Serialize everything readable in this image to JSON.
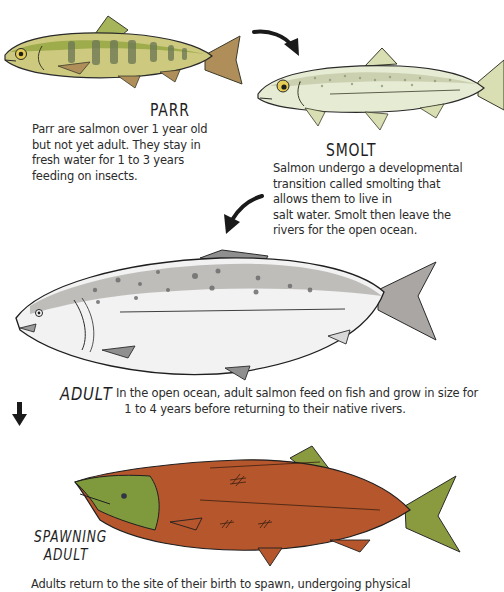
{
  "diagram": {
    "type": "life-cycle",
    "subject": "Salmon",
    "stages": [
      {
        "name": "PARR",
        "description_lines": [
          "Parr are salmon over 1 year old",
          "but not yet adult. They stay in",
          "fresh water for 1 to 3 years",
          "feeding on insects."
        ],
        "colors": {
          "body": "#c9c77a",
          "back": "#8ea23a",
          "bars": "#6f7a55",
          "fins": "#b08e5a"
        }
      },
      {
        "name": "SMOLT",
        "description_lines": [
          "Salmon undergo a developmental",
          "transition called smolting that",
          "allows them to live in",
          "salt water. Smolt then leave the",
          "rivers for the open ocean."
        ],
        "colors": {
          "body": "#e6ecd3",
          "back": "#c4c9a8",
          "fins": "#d9dfb2"
        }
      },
      {
        "name": "ADULT",
        "description_lines": [
          "In the open ocean, adult salmon feed on fish and grow in size for",
          "1 to 4 years before returning to their native rivers."
        ],
        "colors": {
          "body": "#f2f2f2",
          "back": "#a9a6a3",
          "spots": "#6e6e6e",
          "fins": "#8f8f8f"
        }
      },
      {
        "name_lines": [
          "SPAWNING",
          "ADULT"
        ],
        "name": "SPAWNING ADULT",
        "description_lines": [
          "Adults return to the site of their birth to spawn, undergoing physical"
        ],
        "colors": {
          "body": "#b5562d",
          "head": "#7e9a3c",
          "fins": "#8a9a3e"
        }
      }
    ],
    "arrows": [
      {
        "from": "PARR",
        "to": "SMOLT",
        "direction": "right-down"
      },
      {
        "from": "SMOLT",
        "to": "ADULT",
        "direction": "left-down"
      },
      {
        "from": "ADULT",
        "to": "SPAWNING ADULT",
        "direction": "down"
      }
    ]
  }
}
